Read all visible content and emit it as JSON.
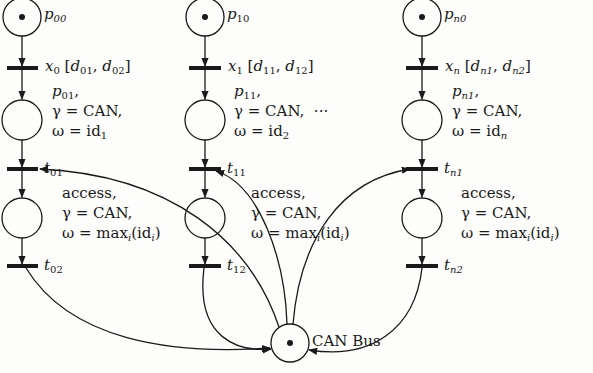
{
  "diagram": {
    "type": "petri-net",
    "colors": {
      "ink": "#1a1a1a",
      "background": "#fdfdfb"
    },
    "columns": [
      {
        "index": "0",
        "start_place": {
          "name": "p",
          "sub": "00",
          "token": true
        },
        "timed_transition": {
          "name": "x",
          "sub": "0",
          "interval": "[d01, d02]",
          "d1_sub": "01",
          "d2_sub": "02"
        },
        "ready_place": {
          "name": "p",
          "sub": "01",
          "gamma": "γ = CAN,",
          "omega_prefix": "ω = id",
          "omega_sub": "1"
        },
        "acquire_transition": {
          "name": "t",
          "sub": "01"
        },
        "access_place": {
          "title": "access,",
          "gamma": "γ = CAN,",
          "omega": "ω = max",
          "omega_sub": "i",
          "omega_tail": "(id",
          "omega_tail_sub": "i",
          "omega_close": ")"
        },
        "release_transition": {
          "name": "t",
          "sub": "02"
        }
      },
      {
        "index": "1",
        "start_place": {
          "name": "p",
          "sub": "10",
          "token": true
        },
        "timed_transition": {
          "name": "x",
          "sub": "1",
          "interval": "[d11, d12]",
          "d1_sub": "11",
          "d2_sub": "12"
        },
        "ready_place": {
          "name": "p",
          "sub": "11",
          "gamma": "γ = CAN,",
          "omega_prefix": "ω = id",
          "omega_sub": "2"
        },
        "acquire_transition": {
          "name": "t",
          "sub": "11"
        },
        "access_place": {
          "title": "access,",
          "gamma": "γ = CAN,",
          "omega": "ω = max",
          "omega_sub": "i",
          "omega_tail": "(id",
          "omega_tail_sub": "i",
          "omega_close": ")"
        },
        "release_transition": {
          "name": "t",
          "sub": "12"
        }
      },
      {
        "index": "n",
        "start_place": {
          "name": "p",
          "sub": "n0",
          "token": true
        },
        "timed_transition": {
          "name": "x",
          "sub": "n",
          "interval": "[dn1, dn2]",
          "d1_sub": "n1",
          "d2_sub": "n2"
        },
        "ready_place": {
          "name": "p",
          "sub": "n1",
          "gamma": "γ = CAN,",
          "omega_prefix": "ω = id",
          "omega_sub": "n"
        },
        "acquire_transition": {
          "name": "t",
          "sub": "n1"
        },
        "access_place": {
          "title": "access,",
          "gamma": "γ = CAN,",
          "omega": "ω = max",
          "omega_sub": "i",
          "omega_tail": "(id",
          "omega_tail_sub": "i",
          "omega_close": ")"
        },
        "release_transition": {
          "name": "t",
          "sub": "n2"
        }
      }
    ],
    "ellipsis": "···",
    "shared_resource": {
      "label": "CAN Bus",
      "token": true
    },
    "arcs": [
      "CAN Bus → t01",
      "CAN Bus → t11",
      "CAN Bus → tn1",
      "t02 → CAN Bus",
      "t12 → CAN Bus",
      "tn2 → CAN Bus"
    ]
  }
}
